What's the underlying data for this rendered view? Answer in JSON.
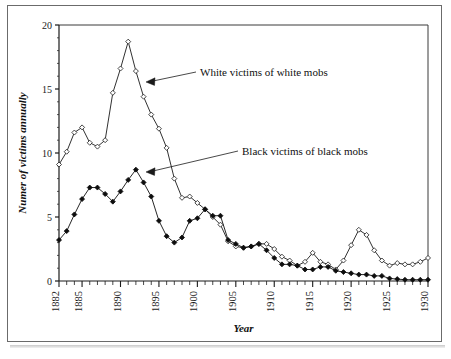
{
  "figure": {
    "frame_color": "#6b6b6b",
    "background": "#ffffff"
  },
  "chart_data": {
    "type": "line",
    "title": "",
    "xlabel": "Year",
    "ylabel": "Numer of victims annually",
    "xlim": [
      1882,
      1930
    ],
    "ylim": [
      0,
      20
    ],
    "yticks": [
      0,
      5,
      10,
      15,
      20
    ],
    "ytick_labels": [
      "0",
      "5",
      "10",
      "15",
      "20"
    ],
    "xticks": [
      1882,
      1885,
      1890,
      1895,
      1900,
      1905,
      1910,
      1915,
      1920,
      1925,
      1930
    ],
    "xtick_labels": [
      "1882",
      "1885",
      "1890",
      "1895",
      "1900",
      "1905",
      "1910",
      "1915",
      "1920",
      "1925",
      "1930"
    ],
    "grid": false,
    "legend": "annotations",
    "x": [
      1882,
      1883,
      1884,
      1885,
      1886,
      1887,
      1888,
      1889,
      1890,
      1891,
      1892,
      1893,
      1894,
      1895,
      1896,
      1897,
      1898,
      1899,
      1900,
      1901,
      1902,
      1903,
      1904,
      1905,
      1906,
      1907,
      1908,
      1909,
      1910,
      1911,
      1912,
      1913,
      1914,
      1915,
      1916,
      1917,
      1918,
      1919,
      1920,
      1921,
      1922,
      1923,
      1924,
      1925,
      1926,
      1927,
      1928,
      1929,
      1930
    ],
    "series": [
      {
        "name": "White victims of white mobs",
        "marker": "open-diamond",
        "color": "#1a1a1a",
        "fill": "#ffffff",
        "values": [
          9.1,
          10.1,
          11.6,
          12.0,
          10.8,
          10.5,
          11.0,
          14.7,
          16.6,
          18.7,
          16.4,
          14.4,
          13.0,
          11.9,
          10.4,
          8.0,
          6.5,
          6.6,
          6.1,
          5.6,
          5.0,
          4.4,
          3.1,
          2.7,
          2.6,
          2.7,
          2.9,
          2.9,
          2.5,
          1.9,
          1.6,
          1.2,
          1.5,
          2.2,
          1.5,
          1.3,
          0.9,
          1.6,
          2.8,
          4.0,
          3.6,
          2.4,
          1.6,
          1.2,
          1.4,
          1.3,
          1.3,
          1.5,
          1.8
        ]
      },
      {
        "name": "Black victims of black mobs",
        "marker": "filled-diamond",
        "color": "#0d0d0d",
        "fill": "#0d0d0d",
        "values": [
          3.2,
          3.9,
          5.2,
          6.4,
          7.3,
          7.3,
          6.8,
          6.2,
          7.0,
          7.9,
          8.7,
          7.7,
          6.6,
          4.7,
          3.5,
          3.0,
          3.4,
          4.7,
          4.9,
          5.6,
          5.1,
          5.1,
          3.2,
          2.9,
          2.6,
          2.7,
          2.9,
          2.4,
          1.8,
          1.3,
          1.3,
          1.2,
          0.9,
          0.9,
          1.1,
          1.1,
          0.8,
          0.7,
          0.6,
          0.5,
          0.5,
          0.4,
          0.4,
          0.2,
          0.15,
          0.1,
          0.1,
          0.1,
          0.1
        ]
      }
    ],
    "annotations": [
      {
        "label": "White victims of white mobs",
        "text_x": 200,
        "text_y": 72,
        "arrow_from_x": 196,
        "arrow_from_y": 72,
        "arrow_to_x": 146,
        "arrow_to_y": 82
      },
      {
        "label": "Black victims of black mobs",
        "text_x": 242,
        "text_y": 151,
        "arrow_from_x": 238,
        "arrow_from_y": 151,
        "arrow_to_x": 146,
        "arrow_to_y": 172
      }
    ]
  }
}
